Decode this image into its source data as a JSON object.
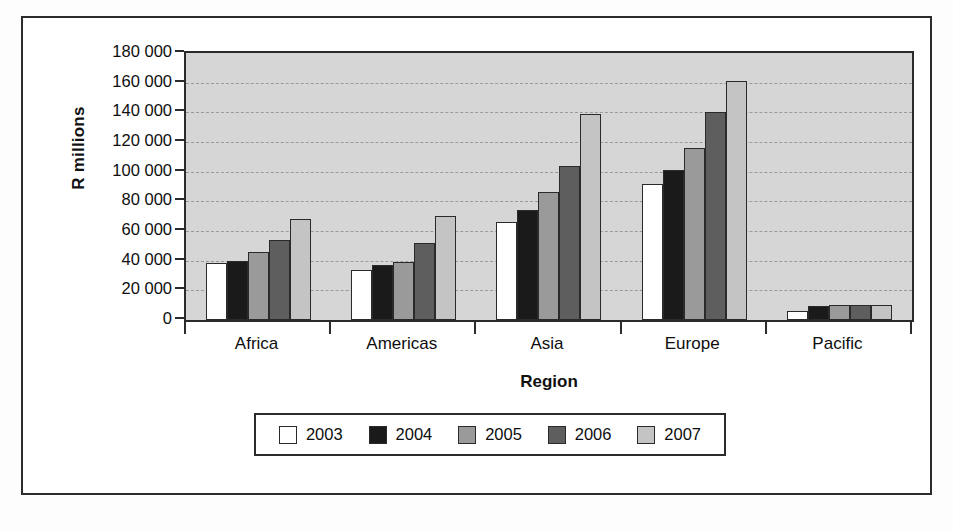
{
  "chart_data": {
    "type": "bar",
    "title": "",
    "xlabel": "Region",
    "ylabel": "R millions",
    "categories": [
      "Africa",
      "Americas",
      "Asia",
      "Europe",
      "Pacific"
    ],
    "ylim": [
      0,
      180000
    ],
    "ytick_step": 20000,
    "ytick_labels": [
      "180 000",
      "160 000",
      "140 000",
      "120 000",
      "100 000",
      "80 000",
      "60 000",
      "40 000",
      "20 000",
      "0"
    ],
    "ytick_values": [
      180000,
      160000,
      140000,
      120000,
      100000,
      80000,
      60000,
      40000,
      20000,
      0
    ],
    "grid": true,
    "legend_position": "bottom",
    "series": [
      {
        "name": "2003",
        "color": "#ffffff",
        "values": [
          38500,
          34000,
          66000,
          92000,
          6000
        ]
      },
      {
        "name": "2004",
        "color": "#1a1a1a",
        "values": [
          40000,
          37000,
          74000,
          101000,
          9500
        ]
      },
      {
        "name": "2005",
        "color": "#9a9a9a",
        "values": [
          46000,
          39000,
          86000,
          116000,
          10000
        ]
      },
      {
        "name": "2006",
        "color": "#5e5e5e",
        "values": [
          54000,
          52000,
          104000,
          140000,
          10000
        ]
      },
      {
        "name": "2007",
        "color": "#c4c4c4",
        "values": [
          68000,
          70000,
          139000,
          161000,
          10000
        ]
      }
    ],
    "plot_background": "#d6d6d6",
    "axis_color": "#2b2b2b",
    "grid_color": "#9a9a9a"
  }
}
